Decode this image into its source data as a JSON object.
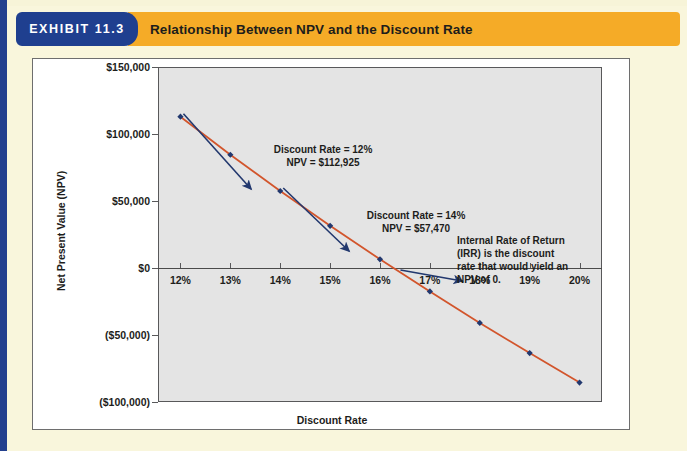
{
  "header": {
    "badge": "EXHIBIT 11.3",
    "title": "Relationship Between NPV and the Discount Rate",
    "badge_color": "#1f3f8f",
    "title_bar_color": "#f5ab27",
    "page_background": "#f9f6dc"
  },
  "chart_data": {
    "type": "line",
    "title": "Relationship Between NPV and the Discount Rate",
    "xlabel": "Discount Rate",
    "ylabel": "Net Present Value (NPV)",
    "categories": [
      "12%",
      "13%",
      "14%",
      "15%",
      "16%",
      "17%",
      "18%",
      "19%",
      "20%"
    ],
    "x": [
      12,
      13,
      14,
      15,
      16,
      17,
      18,
      19,
      20
    ],
    "values": [
      112925,
      84500,
      57470,
      31500,
      6500,
      -17500,
      -41000,
      -63500,
      -85500
    ],
    "series": [
      {
        "name": "Net Present Value (NPV)",
        "values": [
          112925,
          84500,
          57470,
          31500,
          6500,
          -17500,
          -41000,
          -63500,
          -85500
        ],
        "line_color": "#d2552c",
        "marker_color": "#22386e",
        "marker": "diamond"
      }
    ],
    "ytick_labels": [
      "$150,000",
      "$100,000",
      "$50,000",
      "$0",
      "($50,000)",
      "($100,000)"
    ],
    "ytick_values": [
      150000,
      100000,
      50000,
      0,
      -50000,
      -100000
    ],
    "ylim": [
      -100000,
      150000
    ],
    "xlim": [
      11.55,
      20.45
    ],
    "grid": false,
    "legend": "none",
    "plot_background": "#e4e4e4",
    "zero_line": 0,
    "irr_crossing": 16.35,
    "annotations": [
      {
        "id": "annotation-12pct",
        "lines": [
          "Discount Rate = 12%",
          "NPV = $112,925"
        ],
        "text": "Discount Rate = 12%\nNPV = $112,925",
        "points_to_x": 12,
        "points_to_y": 112925,
        "arrow_color": "#22386e"
      },
      {
        "id": "annotation-14pct",
        "lines": [
          "Discount Rate = 14%",
          "NPV = $57,470"
        ],
        "text": "Discount Rate = 14%\nNPV = $57,470",
        "points_to_x": 14,
        "points_to_y": 57470,
        "arrow_color": "#22386e"
      },
      {
        "id": "annotation-irr",
        "lines": [
          "Internal Rate of Return",
          "(IRR) is the discount",
          "rate that would yield an",
          "NPV of 0."
        ],
        "text": "Internal Rate of Return\n(IRR) is the discount\nrate that would yield an\nNPV of 0.",
        "points_to_x": 16.35,
        "points_to_y": 0,
        "arrow_color": "#22386e"
      }
    ]
  }
}
